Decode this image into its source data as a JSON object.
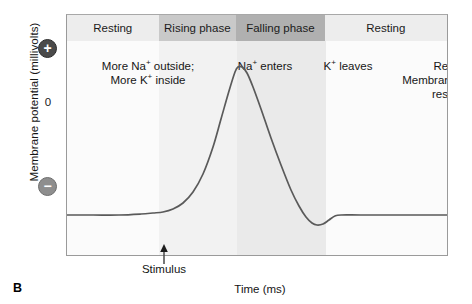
{
  "figure": {
    "panel_letter": "B",
    "x_axis_label": "Time (ms)",
    "y_axis_label": "Membrane potential (millivolts)",
    "zero_tick": "0",
    "positive_symbol": "+",
    "negative_symbol": "−",
    "stimulus_label": "Stimulus"
  },
  "phases": [
    {
      "label": "Resting",
      "fill": "#ededed"
    },
    {
      "label": "Rising phase",
      "fill": "#c9c9c9"
    },
    {
      "label": "Falling phase",
      "fill": "#b0b0b0"
    },
    {
      "label": "Resting",
      "fill": "#ededed"
    }
  ],
  "annotations": {
    "resting_left_line1": "More Na",
    "resting_left_line1_charge": "+",
    "resting_left_line1_tail": " outside;",
    "resting_left_line2": "More K",
    "resting_left_line2_charge": "+",
    "resting_left_line2_tail": " inside",
    "rising": "Na",
    "rising_charge": "+",
    "rising_tail": " enters",
    "falling": "K",
    "falling_charge": "+",
    "falling_tail": " leaves",
    "resting_right_line1": "Resting",
    "resting_right_line2": "Membrane potential",
    "resting_right_line3": "restored"
  },
  "chart_data": {
    "type": "line",
    "xlabel": "Time (ms)",
    "ylabel": "Membrane potential (millivolts)",
    "grid": false,
    "legend": false,
    "axis_markers": {
      "positive": "+",
      "zero": "0",
      "negative": "−"
    },
    "phase_boundaries_px": [
      66,
      158,
      236,
      325,
      447
    ],
    "phase_names": [
      "Resting",
      "Rising phase",
      "Falling phase",
      "Resting"
    ],
    "baseline_y_px": 214,
    "peak_px": {
      "x": 237,
      "y": 66
    },
    "trough_px": {
      "x": 316,
      "y": 224
    },
    "stimulus_x_px": 163,
    "series": [
      {
        "name": "Membrane potential",
        "color": "#5a5a5a",
        "points_px": [
          [
            66,
            214
          ],
          [
            92,
            214
          ],
          [
            118,
            214
          ],
          [
            140,
            213
          ],
          [
            152,
            212
          ],
          [
            162,
            211
          ],
          [
            172,
            208
          ],
          [
            182,
            202
          ],
          [
            192,
            191
          ],
          [
            202,
            173
          ],
          [
            212,
            146
          ],
          [
            220,
            118
          ],
          [
            228,
            90
          ],
          [
            234,
            71
          ],
          [
            237,
            66
          ],
          [
            241,
            66
          ],
          [
            246,
            72
          ],
          [
            252,
            86
          ],
          [
            260,
            108
          ],
          [
            270,
            137
          ],
          [
            280,
            164
          ],
          [
            290,
            189
          ],
          [
            298,
            205
          ],
          [
            305,
            216
          ],
          [
            311,
            222
          ],
          [
            316,
            224
          ],
          [
            322,
            223
          ],
          [
            328,
            219
          ],
          [
            334,
            215
          ],
          [
            340,
            214
          ],
          [
            360,
            214
          ],
          [
            400,
            214
          ],
          [
            447,
            214
          ]
        ]
      }
    ]
  }
}
